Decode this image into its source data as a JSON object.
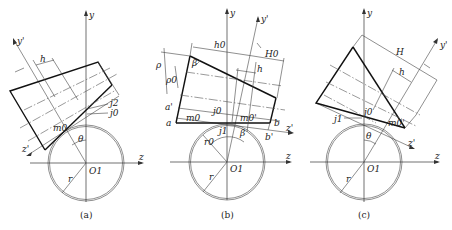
{
  "figure": {
    "panels": [
      {
        "id": "a",
        "caption": "(a)",
        "center": [
          86,
          163
        ],
        "radius": 38,
        "axes": {
          "y_label": "y",
          "z_label": "z",
          "origin_label": "O1"
        },
        "rotated_axes": {
          "y_label": "y'",
          "z_label": "z'"
        },
        "labels": {
          "h": "h",
          "j2": "j2",
          "j0": "j0",
          "m0": "m0",
          "theta": "θ",
          "r": "r"
        }
      },
      {
        "id": "b",
        "caption": "(b)",
        "center": [
          227,
          162
        ],
        "radius": 38,
        "axes": {
          "y_label": "y",
          "z_label": "z",
          "origin_label": "O1"
        },
        "rotated_axes": {
          "y_label": "y'",
          "z_label": "z'"
        },
        "labels": {
          "h0": "h0",
          "H0": "H0",
          "h": "h",
          "rho": "ρ",
          "rho0": "ρ0",
          "beta_top": "β",
          "beta": "β",
          "a_prime": "a'",
          "a": "a",
          "b": "b",
          "b_prime": "b'",
          "m0": "m0",
          "m0_prime": "m0'",
          "j0": "j0",
          "j1": "j1",
          "r0": "r0",
          "r": "r"
        }
      },
      {
        "id": "c",
        "caption": "(c)",
        "center": [
          364,
          162
        ],
        "radius": 38,
        "axes": {
          "y_label": "y",
          "z_label": "z",
          "origin_label": "O1"
        },
        "rotated_axes": {
          "y_label": "y'",
          "z_label": "z'"
        },
        "labels": {
          "H": "H",
          "h": "h",
          "j0": "j0",
          "j1": "j1",
          "m0": "m0'",
          "theta": "θ",
          "r": "r"
        }
      }
    ]
  }
}
